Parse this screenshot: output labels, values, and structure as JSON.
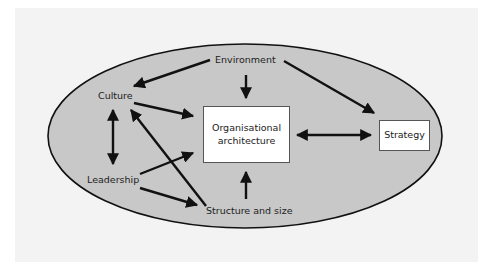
{
  "diagram": {
    "type": "influence-diagram",
    "colors": {
      "page_background": "#f3f3f3",
      "ellipse_fill": "#c8c8c8",
      "ellipse_stroke": "#111111",
      "arrow": "#111111",
      "box_fill": "#ffffff",
      "text": "#222222"
    },
    "nodes": {
      "environment": {
        "label": "Environment"
      },
      "culture": {
        "label": "Culture"
      },
      "leadership": {
        "label": "Leadership"
      },
      "structure": {
        "label": "Structure and size"
      },
      "org_architecture": {
        "line1": "Organisational",
        "line2": "architecture"
      },
      "strategy": {
        "label": "Strategy"
      }
    },
    "edges": [
      {
        "from": "Environment",
        "to": "Culture",
        "direction": "one-way"
      },
      {
        "from": "Environment",
        "to": "Organisational architecture",
        "direction": "one-way"
      },
      {
        "from": "Environment",
        "to": "Strategy",
        "direction": "one-way"
      },
      {
        "from": "Culture",
        "to": "Organisational architecture",
        "direction": "one-way"
      },
      {
        "from": "Culture",
        "to": "Leadership",
        "direction": "two-way"
      },
      {
        "from": "Structure and size",
        "to": "Culture",
        "direction": "one-way"
      },
      {
        "from": "Leadership",
        "to": "Organisational architecture",
        "direction": "one-way"
      },
      {
        "from": "Leadership",
        "to": "Structure and size",
        "direction": "one-way"
      },
      {
        "from": "Structure and size",
        "to": "Organisational architecture",
        "direction": "one-way"
      },
      {
        "from": "Organisational architecture",
        "to": "Strategy",
        "direction": "two-way"
      }
    ]
  }
}
